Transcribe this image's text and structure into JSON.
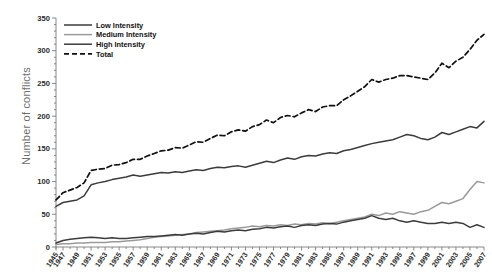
{
  "figure": {
    "y_axis_title": "Number of conflicts"
  },
  "legend": {
    "position": "top-left",
    "items": [
      {
        "label": "Low Intensity",
        "style": "solid",
        "color": "#3c3c3c"
      },
      {
        "label": "Medium Intensity",
        "style": "solid",
        "color": "#9a9a9a"
      },
      {
        "label": "High Intensity",
        "style": "solid",
        "color": "#3c3c3c"
      },
      {
        "label": "Total",
        "style": "dashed",
        "color": "#111111"
      }
    ]
  },
  "chart_data": {
    "type": "line",
    "title": "",
    "xlabel": "",
    "ylabel": "Number of conflicts",
    "ylim": [
      0,
      350
    ],
    "ytick_values": [
      0,
      50,
      100,
      150,
      200,
      250,
      300,
      350
    ],
    "ytick_labels": [
      "0",
      "50",
      "100",
      "150",
      "200",
      "250",
      "300",
      "350"
    ],
    "xlim": [
      1946,
      2007
    ],
    "grid": false,
    "xtick_labels": [
      "1945",
      "1947",
      "1949",
      "1951",
      "1953",
      "1955",
      "1957",
      "1959",
      "1961",
      "1963",
      "1965",
      "1967",
      "1969",
      "1971",
      "1973",
      "1975",
      "1977",
      "1979",
      "1981",
      "1983",
      "1985",
      "1987",
      "1989",
      "1991",
      "1993",
      "1995",
      "1997",
      "1999",
      "2001",
      "2003",
      "2005",
      "2007"
    ],
    "x": [
      1946,
      1947,
      1948,
      1949,
      1950,
      1951,
      1952,
      1953,
      1954,
      1955,
      1956,
      1957,
      1958,
      1959,
      1960,
      1961,
      1962,
      1963,
      1964,
      1965,
      1966,
      1967,
      1968,
      1969,
      1970,
      1971,
      1972,
      1973,
      1974,
      1975,
      1976,
      1977,
      1978,
      1979,
      1980,
      1981,
      1982,
      1983,
      1984,
      1985,
      1986,
      1987,
      1988,
      1989,
      1990,
      1991,
      1992,
      1993,
      1994,
      1995,
      1996,
      1997,
      1998,
      1999,
      2000,
      2001,
      2002,
      2003,
      2004,
      2005,
      2006,
      2007
    ],
    "series": [
      {
        "name": "Low Intensity",
        "color": "#3c3c3c",
        "style": "solid",
        "values": [
          62,
          68,
          70,
          72,
          78,
          95,
          98,
          100,
          103,
          105,
          107,
          110,
          108,
          110,
          112,
          114,
          113,
          115,
          114,
          116,
          118,
          117,
          120,
          122,
          121,
          123,
          124,
          122,
          125,
          128,
          131,
          129,
          133,
          136,
          134,
          138,
          140,
          139,
          142,
          144,
          143,
          147,
          149,
          152,
          155,
          158,
          160,
          162,
          164,
          168,
          172,
          170,
          166,
          164,
          168,
          175,
          172,
          176,
          180,
          184,
          182,
          192
        ]
      },
      {
        "name": "Medium Intensity",
        "color": "#9a9a9a",
        "style": "solid",
        "values": [
          4,
          5,
          5,
          6,
          6,
          7,
          7,
          7,
          8,
          8,
          9,
          10,
          11,
          13,
          15,
          16,
          17,
          18,
          19,
          20,
          22,
          23,
          24,
          25,
          26,
          28,
          29,
          30,
          32,
          31,
          33,
          32,
          34,
          33,
          35,
          34,
          36,
          35,
          37,
          36,
          38,
          40,
          42,
          44,
          46,
          50,
          48,
          52,
          50,
          54,
          52,
          50,
          54,
          56,
          62,
          68,
          66,
          70,
          74,
          88,
          100,
          98
        ]
      },
      {
        "name": "High Intensity",
        "color": "#3c3c3c",
        "style": "solid",
        "values": [
          6,
          10,
          12,
          13,
          14,
          15,
          14,
          13,
          14,
          13,
          13,
          14,
          15,
          16,
          16,
          17,
          18,
          19,
          18,
          20,
          21,
          20,
          22,
          24,
          23,
          25,
          26,
          25,
          27,
          28,
          30,
          29,
          31,
          32,
          30,
          33,
          34,
          33,
          35,
          36,
          35,
          38,
          40,
          42,
          44,
          48,
          44,
          42,
          44,
          40,
          38,
          40,
          38,
          36,
          36,
          38,
          36,
          38,
          36,
          30,
          34,
          30
        ]
      },
      {
        "name": "Total",
        "color": "#111111",
        "style": "dashed",
        "values": [
          72,
          83,
          87,
          91,
          98,
          117,
          119,
          120,
          125,
          126,
          129,
          134,
          134,
          139,
          143,
          147,
          148,
          152,
          151,
          156,
          161,
          160,
          166,
          171,
          170,
          176,
          179,
          177,
          184,
          187,
          194,
          190,
          198,
          201,
          199,
          205,
          210,
          207,
          214,
          216,
          216,
          225,
          231,
          238,
          245,
          256,
          252,
          256,
          258,
          262,
          262,
          260,
          258,
          256,
          266,
          281,
          274,
          284,
          290,
          302,
          316,
          325
        ]
      }
    ]
  }
}
